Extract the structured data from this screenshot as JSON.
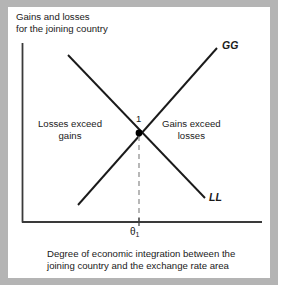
{
  "figure": {
    "type": "line-diagram",
    "y_axis_label": "Gains and losses\nfor the joining country",
    "x_axis_caption": "Degree of economic integration between the\njoining country and the exchange rate area",
    "curves": [
      {
        "id": "GG",
        "label": "GG",
        "slope": "upward",
        "from": [
          78,
          205
        ],
        "to": [
          217,
          48
        ]
      },
      {
        "id": "LL",
        "label": "LL",
        "slope": "downward",
        "from": [
          68,
          55
        ],
        "to": [
          205,
          198
        ]
      }
    ],
    "regions": [
      {
        "id": "left",
        "text": "Losses exceed\ngains"
      },
      {
        "id": "right",
        "text": "Gains exceed\nlosses"
      }
    ],
    "intersection": {
      "label": "1",
      "x_tick_label": "θ",
      "x_tick_subscript": "1",
      "marker": "filled-dot"
    },
    "colors": {
      "frame": "#b4b4b4",
      "panel": "#ffffff",
      "axis": "#3a3a3a",
      "curve": "#1a1a1a",
      "dashed_guide": "#9a9a9a",
      "text": "#1a1a1a"
    }
  }
}
